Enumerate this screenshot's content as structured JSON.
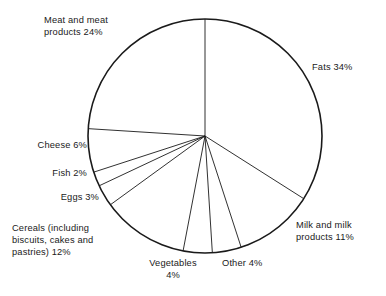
{
  "chart_data": {
    "type": "pie",
    "title": "",
    "subtitle": "",
    "xlabel": "",
    "ylabel": "",
    "legend_position": "none",
    "grid": false,
    "units": "percent",
    "start_angle_deg": 0,
    "direction": "clockwise",
    "total": 100,
    "categories": [
      "Fats",
      "Milk and milk products",
      "Other",
      "Vegetables",
      "Cereals (including biscuits, cakes and pastries)",
      "Eggs",
      "Fish",
      "Cheese",
      "Meat and meat products"
    ],
    "values": [
      34,
      11,
      4,
      4,
      12,
      3,
      2,
      6,
      24
    ],
    "slices": [
      {
        "name": "Fats",
        "value": 34,
        "label": "Fats 34%"
      },
      {
        "name": "Milk and milk products",
        "value": 11,
        "label": "Milk and milk products 11%"
      },
      {
        "name": "Other",
        "value": 4,
        "label": "Other 4%"
      },
      {
        "name": "Vegetables",
        "value": 4,
        "label": "Vegetables 4%"
      },
      {
        "name": "Cereals (including biscuits, cakes and pastries)",
        "value": 12,
        "label": "Cereals (including biscuits, cakes and pastries) 12%"
      },
      {
        "name": "Eggs",
        "value": 3,
        "label": "Eggs 3%"
      },
      {
        "name": "Fish",
        "value": 2,
        "label": "Fish 2%"
      },
      {
        "name": "Cheese",
        "value": 6,
        "label": "Cheese 6%"
      },
      {
        "name": "Meat and meat products",
        "value": 24,
        "label": "Meat and meat products 24%"
      }
    ]
  },
  "labels": {
    "meat": {
      "line1": "Meat and meat",
      "line2": "products 24%"
    },
    "fats": {
      "line1": "Fats 34%"
    },
    "cheese": {
      "line1": "Cheese 6%"
    },
    "fish": {
      "line1": "Fish 2%"
    },
    "eggs": {
      "line1": "Eggs 3%"
    },
    "cereals": {
      "line1": "Cereals (including",
      "line2": "biscuits, cakes and",
      "line3": "pastries) 12%"
    },
    "vegetables": {
      "line1": "Vegetables",
      "line2": "4%"
    },
    "other": {
      "line1": "Other 4%"
    },
    "milk": {
      "line1": "Milk and milk",
      "line2": "products 11%"
    }
  },
  "style": {
    "stroke": "#1a1a1a",
    "fill": "#ffffff",
    "background": "#ffffff"
  },
  "geometry": {
    "center_x": 205,
    "center_y": 136,
    "radius": 117
  }
}
